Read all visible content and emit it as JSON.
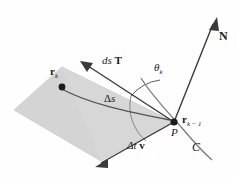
{
  "figure": {
    "background_color": "#fefefe",
    "plane_fill_color": "#d4d4d4",
    "plane_stroke_color": "#c0c0c0",
    "line_color": "#3a3a3a",
    "curve_color": "#6a6a6a",
    "text_color": "#1a1a1a"
  },
  "labels": {
    "normal_vector": "N",
    "tangent_vector_pre": "ds",
    "tangent_vector_bold": "T",
    "angle": "θ",
    "angle_sub": "k",
    "point_rk": "r",
    "point_rk_sub": "k",
    "point_rk1": "r",
    "point_rk1_sub": "k − 1",
    "arc_length_pre": "Δ",
    "arc_length_var": "s",
    "velocity_pre": "Δt",
    "velocity_bold": "v",
    "point_p": "P",
    "curve": "C"
  },
  "geometry": {
    "plane_vertices": "14,110 62,67 174,122 101,161",
    "point_p": {
      "x": 174,
      "y": 122
    },
    "point_rk": {
      "x": 62,
      "y": 87
    },
    "normal_arrow_tip": {
      "x": 216,
      "y": 19
    },
    "tangent_arrow_tip": {
      "x": 82,
      "y": 62
    },
    "velocity_arrow_tip": {
      "x": 97,
      "y": 166
    }
  }
}
